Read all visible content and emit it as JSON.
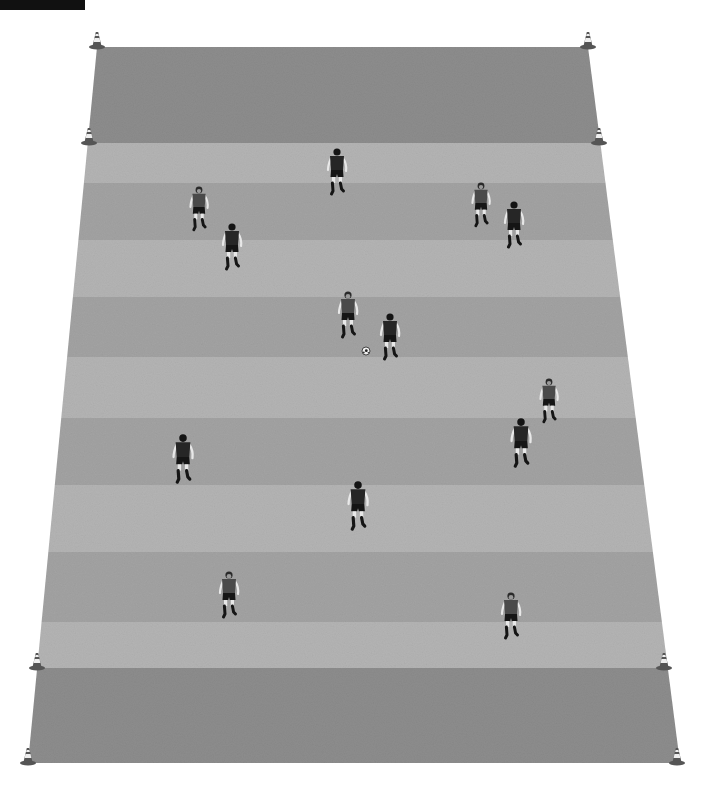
{
  "header": {
    "bar_color": "#111111"
  },
  "colors": {
    "background": "#ffffff",
    "end_zone": "#8d8d8d",
    "stripe_light": "#b4b4b4",
    "stripe_dark": "#a3a3a3",
    "cone_body": "#555555",
    "cone_band": "#eeeeee",
    "shirt_toward": "#4a4a4a",
    "shirt_away": "#262626",
    "shorts": "#151515",
    "skin": "#e8e8e8",
    "socks": "#151515",
    "ball": "#f2f2f2"
  },
  "field": {
    "top_y": 47,
    "top_left_x": 97,
    "top_right_x": 588,
    "bottom_y": 763,
    "bottom_left_x": 28,
    "bottom_right_x": 680,
    "end_zone_top_bottom_y": 143,
    "end_zone_bottom_top_y": 668,
    "stripe_boundaries": [
      143,
      183,
      240,
      297,
      357,
      418,
      485,
      552,
      622,
      668
    ]
  },
  "cones": [
    {
      "id": "cone-top-left-outer",
      "x": 97,
      "y": 47
    },
    {
      "id": "cone-top-right-outer",
      "x": 588,
      "y": 47
    },
    {
      "id": "cone-top-left-inner",
      "x": 89,
      "y": 143
    },
    {
      "id": "cone-top-right-inner",
      "x": 599,
      "y": 143
    },
    {
      "id": "cone-bottom-left-inner",
      "x": 37,
      "y": 668
    },
    {
      "id": "cone-bottom-right-inner",
      "x": 664,
      "y": 668
    },
    {
      "id": "cone-bottom-left-outer",
      "x": 28,
      "y": 763
    },
    {
      "id": "cone-bottom-right-outer",
      "x": 677,
      "y": 763
    }
  ],
  "players": [
    {
      "id": "player-1",
      "facing": "away",
      "x": 337,
      "y": 150,
      "scale": 1.0
    },
    {
      "id": "player-2",
      "facing": "toward",
      "x": 199,
      "y": 188,
      "scale": 0.95
    },
    {
      "id": "player-3",
      "facing": "away",
      "x": 232,
      "y": 225,
      "scale": 1.0
    },
    {
      "id": "player-4",
      "facing": "toward",
      "x": 481,
      "y": 184,
      "scale": 0.95
    },
    {
      "id": "player-5",
      "facing": "away",
      "x": 514,
      "y": 203,
      "scale": 1.0
    },
    {
      "id": "player-6",
      "facing": "toward",
      "x": 348,
      "y": 293,
      "scale": 1.0
    },
    {
      "id": "player-7",
      "facing": "away",
      "x": 390,
      "y": 315,
      "scale": 1.0
    },
    {
      "id": "player-8",
      "facing": "toward",
      "x": 549,
      "y": 380,
      "scale": 0.95
    },
    {
      "id": "player-9",
      "facing": "away",
      "x": 521,
      "y": 420,
      "scale": 1.05
    },
    {
      "id": "player-10",
      "facing": "away",
      "x": 183,
      "y": 436,
      "scale": 1.05
    },
    {
      "id": "player-11",
      "facing": "away",
      "x": 358,
      "y": 483,
      "scale": 1.05
    },
    {
      "id": "player-12",
      "facing": "toward",
      "x": 229,
      "y": 573,
      "scale": 1.0
    },
    {
      "id": "player-13",
      "facing": "toward",
      "x": 511,
      "y": 594,
      "scale": 1.0
    }
  ],
  "ball": {
    "x": 366,
    "y": 351,
    "r": 4
  }
}
